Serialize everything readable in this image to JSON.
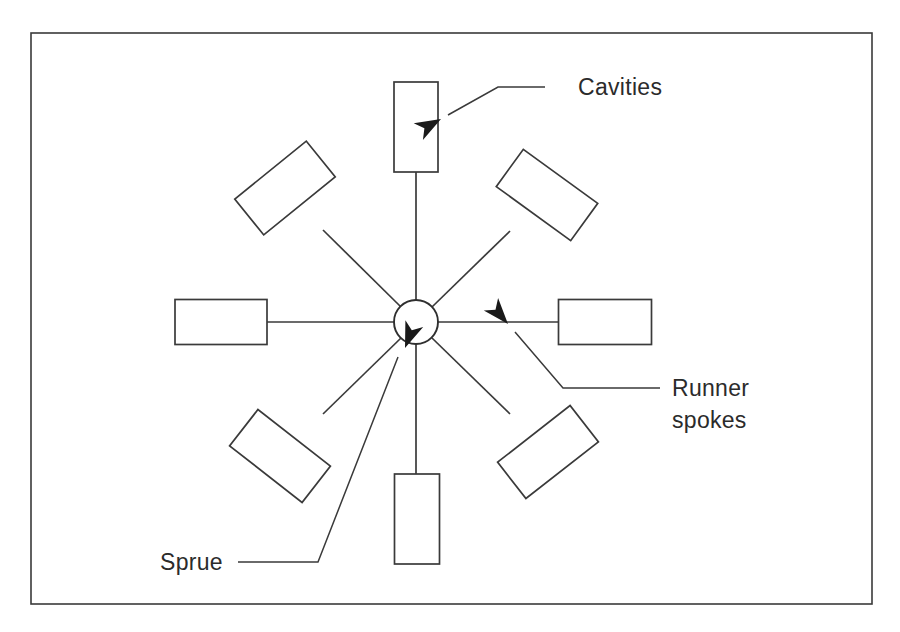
{
  "figure": {
    "type": "injection-mould-runner-layout-diagram",
    "background_color": "#ffffff",
    "line_color": "#3a3a3a",
    "text_color": "#2b2b2b",
    "width": 900,
    "height": 632
  },
  "frame": {
    "x": 31,
    "y": 33,
    "width": 841,
    "height": 571
  },
  "hub": {
    "label": "sprue-hub",
    "cx": 416,
    "cy": 322,
    "r": 22
  },
  "labels": {
    "cavities": "Cavities",
    "runner_spokes_line1": "Runner",
    "runner_spokes_line2": "spokes",
    "sprue": "Sprue"
  },
  "cavities": [
    {
      "name": "cavity-top",
      "cx": 416,
      "cy": 127,
      "w": 44,
      "h": 90,
      "angle": 0
    },
    {
      "name": "cavity-upper-left",
      "cx": 285,
      "cy": 188,
      "w": 92,
      "h": 46,
      "angle": -39
    },
    {
      "name": "cavity-upper-right",
      "cx": 547,
      "cy": 195,
      "w": 92,
      "h": 46,
      "angle": 36
    },
    {
      "name": "cavity-left",
      "cx": 221,
      "cy": 322,
      "w": 92,
      "h": 45,
      "angle": 0
    },
    {
      "name": "cavity-right",
      "cx": 605,
      "cy": 322,
      "w": 93,
      "h": 45,
      "angle": 0
    },
    {
      "name": "cavity-lower-left",
      "cx": 280,
      "cy": 456,
      "w": 92,
      "h": 46,
      "angle": 38
    },
    {
      "name": "cavity-lower-right",
      "cx": 548,
      "cy": 452,
      "w": 92,
      "h": 46,
      "angle": -38
    },
    {
      "name": "cavity-bottom",
      "cx": 417,
      "cy": 519,
      "w": 45,
      "h": 90,
      "angle": 0
    }
  ],
  "spokes": [
    {
      "name": "spoke-top",
      "x1": 416,
      "y1": 300,
      "x2": 416,
      "y2": 172
    },
    {
      "name": "spoke-upper-left",
      "x1": 401,
      "y1": 307,
      "x2": 323,
      "y2": 230
    },
    {
      "name": "spoke-upper-right",
      "x1": 432,
      "y1": 307,
      "x2": 510,
      "y2": 231
    },
    {
      "name": "spoke-left",
      "x1": 394,
      "y1": 322,
      "x2": 267,
      "y2": 322
    },
    {
      "name": "spoke-right",
      "x1": 438,
      "y1": 322,
      "x2": 558,
      "y2": 322
    },
    {
      "name": "spoke-lower-left",
      "x1": 401,
      "y1": 338,
      "x2": 323,
      "y2": 414
    },
    {
      "name": "spoke-lower-right",
      "x1": 432,
      "y1": 338,
      "x2": 510,
      "y2": 414
    },
    {
      "name": "spoke-bottom",
      "x1": 416,
      "y1": 344,
      "x2": 416,
      "y2": 474
    }
  ],
  "leaders": {
    "cavities": {
      "path": "M 545 87 L 498 87 L 448 115",
      "arrow_tip": {
        "x": 441,
        "y": 119
      },
      "arrow_angle": 151,
      "text_x": 578,
      "text_y": 95
    },
    "runner_spokes": {
      "path": "M 660 388 L 563 388 L 515 332",
      "arrow_tip": {
        "x": 508,
        "y": 324
      },
      "arrow_angle": 229,
      "text_x": 672,
      "text_y": 396,
      "text_y2": 428
    },
    "sprue": {
      "path": "M 238 562 L 318 562 L 398 357",
      "arrow_tip": {
        "x": 405,
        "y": 348
      },
      "arrow_angle": 291,
      "text_x": 160,
      "text_y": 570
    }
  }
}
